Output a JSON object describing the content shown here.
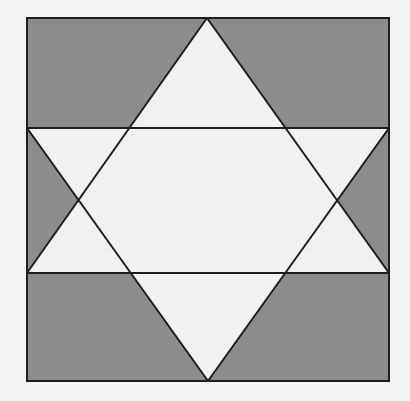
{
  "figure": {
    "title": "Star of David inscribed in a square",
    "colors": {
      "background": "#f3f3f1",
      "shaded": "#8c8c8c",
      "unshaded": "#f1f1ef",
      "stroke": "#1e1e1e"
    },
    "square": {
      "x1": 27,
      "y1": 18,
      "x2": 389,
      "y2": 381
    },
    "up_triangle": [
      [
        207,
        18
      ],
      [
        27,
        273
      ],
      [
        389,
        273
      ]
    ],
    "down_triangle": [
      [
        27,
        128
      ],
      [
        389,
        128
      ],
      [
        208,
        381
      ]
    ],
    "horizontal_lines": [
      128,
      273
    ],
    "left_crossing": [
      81,
      200
    ],
    "right_crossing": [
      337,
      200
    ]
  }
}
